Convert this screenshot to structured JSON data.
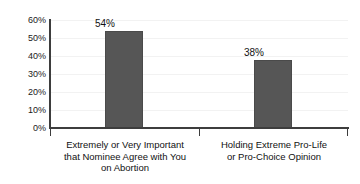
{
  "chart_data": {
    "type": "bar",
    "title": "",
    "subtitle": "",
    "xlabel": "",
    "ylabel": "",
    "categories": [
      "Extremely or Very Important that Nominee Agree with You on Abortion",
      "Holding Extreme Pro-Life or Pro-Choice Opinion"
    ],
    "category_lines": [
      [
        "Extremely or Very Important",
        "that Nominee Agree with You",
        "on Abortion"
      ],
      [
        "Holding Extreme Pro-Life",
        "or Pro-Choice Opinion"
      ]
    ],
    "values": [
      54,
      38
    ],
    "value_labels": [
      "54%",
      "38%"
    ],
    "ylim": [
      0,
      60
    ],
    "ytick_values": [
      60,
      50,
      40,
      30,
      20,
      10,
      0
    ],
    "ytick_labels": [
      "60%",
      "50%",
      "40%",
      "30%",
      "20%",
      "10%",
      "0%"
    ],
    "grid": true,
    "legend": false,
    "legend_position": "none",
    "bar_color": "#565656",
    "axis_color": "#3d3d3d",
    "grid_color": "#f2f2f2",
    "background_color": "#ffffff",
    "text_color": "#111111"
  }
}
